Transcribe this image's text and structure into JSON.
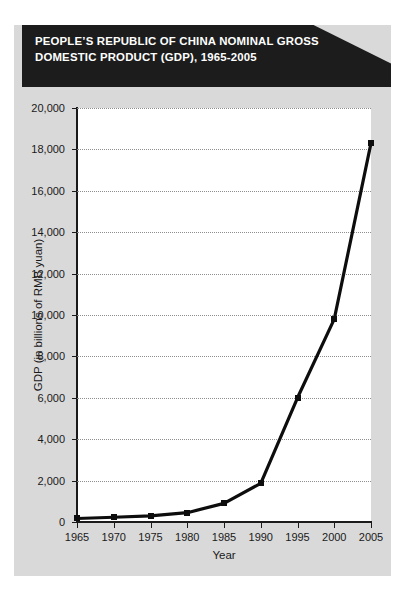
{
  "banner": {
    "line1": "PEOPLE’S REPUBLIC OF CHINA NOMINAL GROSS",
    "line2": "DOMESTIC PRODUCT (GDP), 1965-2005"
  },
  "colors": {
    "panel": "#d9d9d9",
    "banner": "#1c1c1c",
    "plot_background": "#ffffff",
    "line": "#0d0d0d",
    "gridline": "#8e8e8e",
    "axis": "#1a1a1a",
    "text": "#1a1a1a",
    "banner_text": "#ffffff"
  },
  "chart_data": {
    "type": "line",
    "title": "PEOPLE’S REPUBLIC OF CHINA NOMINAL GROSS DOMESTIC PRODUCT (GDP), 1965-2005",
    "xlabel": "Year",
    "ylabel": "GDP (in billions of RMB yuan)",
    "x": [
      1965,
      1970,
      1975,
      1980,
      1985,
      1990,
      1995,
      2000,
      2005
    ],
    "categories": [
      "1965",
      "1970",
      "1975",
      "1980",
      "1985",
      "1990",
      "1995",
      "2000",
      "2005"
    ],
    "values": [
      170,
      230,
      300,
      450,
      900,
      1870,
      6000,
      9800,
      18300
    ],
    "xlim": [
      1965,
      2005
    ],
    "ylim": [
      0,
      20000
    ],
    "ytick_values": [
      0,
      2000,
      4000,
      6000,
      8000,
      10000,
      12000,
      14000,
      16000,
      18000,
      20000
    ],
    "ytick_labels": [
      "0",
      "2,000",
      "4,000",
      "6,000",
      "8,000",
      "10,000",
      "12,000",
      "14,000",
      "16,000",
      "18,000",
      "20,000"
    ],
    "xtick_labels": [
      "1965",
      "1970",
      "1975",
      "1980",
      "1985",
      "1990",
      "1995",
      "2000",
      "2005"
    ],
    "grid": true,
    "legend": false,
    "marker": "square",
    "series": [
      {
        "name": "Nominal GDP",
        "values": [
          170,
          230,
          300,
          450,
          900,
          1870,
          6000,
          9800,
          18300
        ]
      }
    ]
  }
}
